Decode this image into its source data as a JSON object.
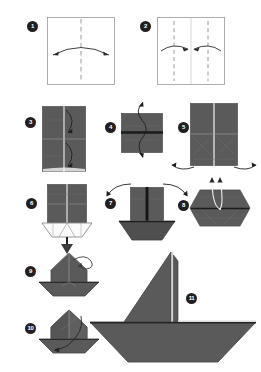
{
  "document": {
    "title": "Origami Sailboat Folding Instructions",
    "header_note": "",
    "background_color": "#ffffff"
  },
  "palette": {
    "paper_front": "#5a5a5a",
    "paper_front_light": "#6a6a6a",
    "paper_shade": "#4a4a4a",
    "paper_dark": "#404040",
    "paper_back": "#f2f2f2",
    "outline": "#9a9a9a",
    "fold_line": "#8d8d8d",
    "arrow": "#2b2b2b",
    "badge_bg": "#231f20",
    "badge_text": "#ffffff"
  },
  "steps": [
    {
      "number": "1",
      "label": "Start with a square sheet, fold in half vertically",
      "shape": "square-white",
      "arrows": "horizontal-double-arc",
      "creases": [
        "vertical-center-dashed"
      ]
    },
    {
      "number": "2",
      "label": "Fold both side edges in to the center crease",
      "shape": "square-white",
      "arrows": "two-inward-arcs",
      "creases": [
        "vertical-quarter-dashed-left",
        "vertical-center-solid",
        "vertical-quarter-dashed-right"
      ]
    },
    {
      "number": "3",
      "label": "Result is a tall rectangle; fold top corners down",
      "shape": "tall-rectangle-gray",
      "arrows": "two-vertical-arcs",
      "creases": [
        "vertical-center",
        "horizontal-mid"
      ]
    },
    {
      "number": "4",
      "label": "Unfold and rotate the model",
      "shape": "wide-rectangle-gray",
      "arrows": "vertical-rotate-arrow",
      "creases": [
        "horizontal-center-dark"
      ]
    },
    {
      "number": "5",
      "label": "Open out the lower flaps to both sides",
      "shape": "tall-rectangle-gray",
      "arrows": "two-outward-bottom-arcs",
      "creases": [
        "vertical-center",
        "horizontal-mid",
        "diagonal-creases"
      ]
    },
    {
      "number": "6",
      "label": "Squash fold forms the hull underneath",
      "shape": "panel-over-white-hull",
      "arrows": "down-arrow",
      "creases": [
        "vertical-center",
        "horizontal-mid"
      ]
    },
    {
      "number": "7",
      "label": "Fold the two upright panels outward",
      "shape": "two-panels-on-hull",
      "arrows": "two-outward-top-arcs",
      "creases": [
        "vertical-center"
      ]
    },
    {
      "number": "8",
      "label": "Flatten into a diamond and lift the inner points",
      "shape": "flat-diamond-gray",
      "arrows": "two-up-thin-arrows",
      "creases": [
        "horizontal-center"
      ]
    },
    {
      "number": "9",
      "label": "Pull the top point over to one side",
      "shape": "boat-with-peak",
      "arrows": "curly-loop-arrow",
      "creases": [
        "vertical-center",
        "hull-fold"
      ]
    },
    {
      "number": "10",
      "label": "Swing the front flap down to shape the sail",
      "shape": "boat-with-open-peak",
      "arrows": "inner-down-left-arc",
      "creases": [
        "vertical-center",
        "diagonal"
      ]
    },
    {
      "number": "11",
      "label": "Finished sailboat",
      "shape": "finished-sailboat",
      "arrows": "none",
      "creases": [
        "mast-line"
      ]
    }
  ]
}
